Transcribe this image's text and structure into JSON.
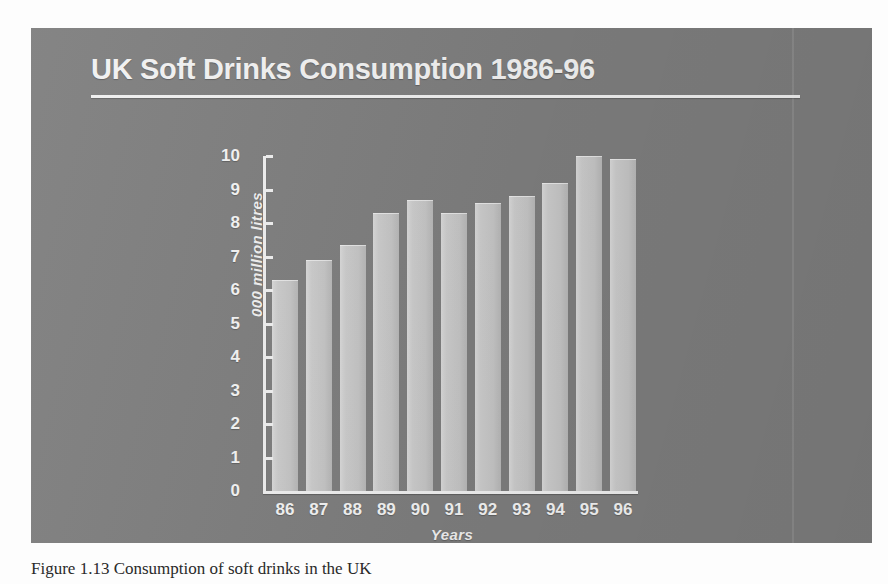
{
  "slide": {
    "title": "UK Soft Drinks Consumption 1986-96",
    "background_color": "#7e7e7e",
    "title_color": "#f2f2f2",
    "bar_color": "#c9c9c9"
  },
  "caption": {
    "text": "Figure 1.13  Consumption of soft drinks in the UK"
  },
  "chart_data": {
    "type": "bar",
    "title": "UK Soft Drinks Consumption 1986-96",
    "subtitle": "",
    "xlabel": "Years",
    "ylabel": "000 million litres",
    "categories": [
      "86",
      "87",
      "88",
      "89",
      "90",
      "91",
      "92",
      "93",
      "94",
      "95",
      "96"
    ],
    "values": [
      6.3,
      6.9,
      7.35,
      8.3,
      8.7,
      8.3,
      8.6,
      8.8,
      9.2,
      10.0,
      9.9
    ],
    "ylim": [
      0,
      10
    ],
    "yticks": [
      0,
      1,
      2,
      3,
      4,
      5,
      6,
      7,
      8,
      9,
      10
    ],
    "ytick_labels": [
      "0",
      "1",
      "2",
      "3",
      "4",
      "5",
      "6",
      "7",
      "8",
      "9",
      "10"
    ],
    "grid": false,
    "legend": false,
    "legend_position": "none",
    "series": [
      {
        "name": "UK soft drinks consumption",
        "values": [
          6.3,
          6.9,
          7.35,
          8.3,
          8.7,
          8.3,
          8.6,
          8.8,
          9.2,
          10.0,
          9.9
        ]
      }
    ]
  }
}
